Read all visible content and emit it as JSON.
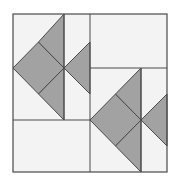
{
  "diagram": {
    "type": "quilt-block",
    "colors": {
      "background": "#ffffff",
      "patch_background": "#f3f3f3",
      "fill": "#a2a2a2",
      "stroke": "#4a4a4a"
    },
    "outer_frame": {
      "x": 13,
      "y": 14,
      "width": 154,
      "height": 158
    },
    "lines": [
      {
        "name": "left-block-vertical-mid",
        "x1": 64,
        "y1": 14,
        "x2": 64,
        "y2": 120
      },
      {
        "name": "center-vertical",
        "x1": 90,
        "y1": 14,
        "x2": 90,
        "y2": 172
      },
      {
        "name": "left-block-bottom",
        "x1": 13,
        "y1": 120,
        "x2": 90,
        "y2": 120
      },
      {
        "name": "right-block-top",
        "x1": 90,
        "y1": 68,
        "x2": 167,
        "y2": 68
      },
      {
        "name": "right-block-vertical-mid",
        "x1": 141,
        "y1": 68,
        "x2": 141,
        "y2": 172
      }
    ],
    "shapes": [
      {
        "name": "left-diamond",
        "points": "13,68 38.5,42 64,68 38.5,94"
      },
      {
        "name": "left-upper-triangle",
        "points": "38.5,42 64,14 64,68"
      },
      {
        "name": "left-lower-triangle",
        "points": "38.5,94 64,120 64,68"
      },
      {
        "name": "left-right-triangle",
        "points": "64,68 90,42 90,94"
      },
      {
        "name": "right-diamond",
        "points": "90,120 115.5,94 141,120 115.5,146"
      },
      {
        "name": "right-upper-triangle",
        "points": "115.5,94 141,68 141,120"
      },
      {
        "name": "right-lower-triangle",
        "points": "115.5,146 141,172 141,120"
      },
      {
        "name": "right-right-triangle",
        "points": "141,120 167,94 167,146"
      }
    ]
  }
}
